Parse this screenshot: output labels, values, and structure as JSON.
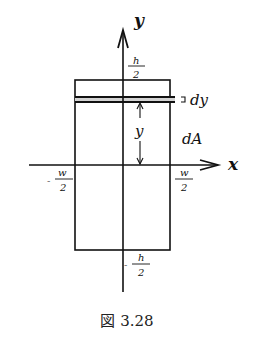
{
  "figure": {
    "caption": "図 3.28",
    "axes": {
      "x_label": "x",
      "y_label": "y"
    },
    "labels": {
      "top_num": "h",
      "top_den": "2",
      "bottom_sign": "-",
      "bottom_num": "h",
      "bottom_den": "2",
      "left_sign": "-",
      "left_num": "w",
      "left_den": "2",
      "right_num": "w",
      "right_den": "2",
      "strip_thickness": "dy",
      "strip_distance": "y",
      "area_element": "dA"
    },
    "colors": {
      "stroke": "#111111",
      "strip_fill": "#cfcfcf",
      "background": "#ffffff"
    }
  }
}
